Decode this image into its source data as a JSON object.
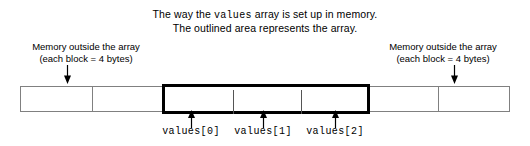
{
  "caption": {
    "line1_before": "The way the ",
    "line1_code": "values",
    "line1_after": " array is set up in memory.",
    "line2": "The outlined area represents the array."
  },
  "labels": {
    "left": {
      "line1": "Memory outside the array",
      "line2": "(each block = 4 bytes)"
    },
    "right": {
      "line1": "Memory outside the array",
      "line2": "(each block = 4 bytes)"
    }
  },
  "array_elements": [
    {
      "label": "values[0]"
    },
    {
      "label": "values[1]"
    },
    {
      "label": "values[2]"
    }
  ],
  "memory_blocks": {
    "outside_left_count": 2,
    "array_cell_count": 3,
    "outside_right_count": 2,
    "block_size_bytes": 4
  },
  "colors": {
    "array_outline": "#000000",
    "memory_border": "#808080",
    "cell_divider": "#555555",
    "background": "#ffffff",
    "text": "#000000"
  }
}
